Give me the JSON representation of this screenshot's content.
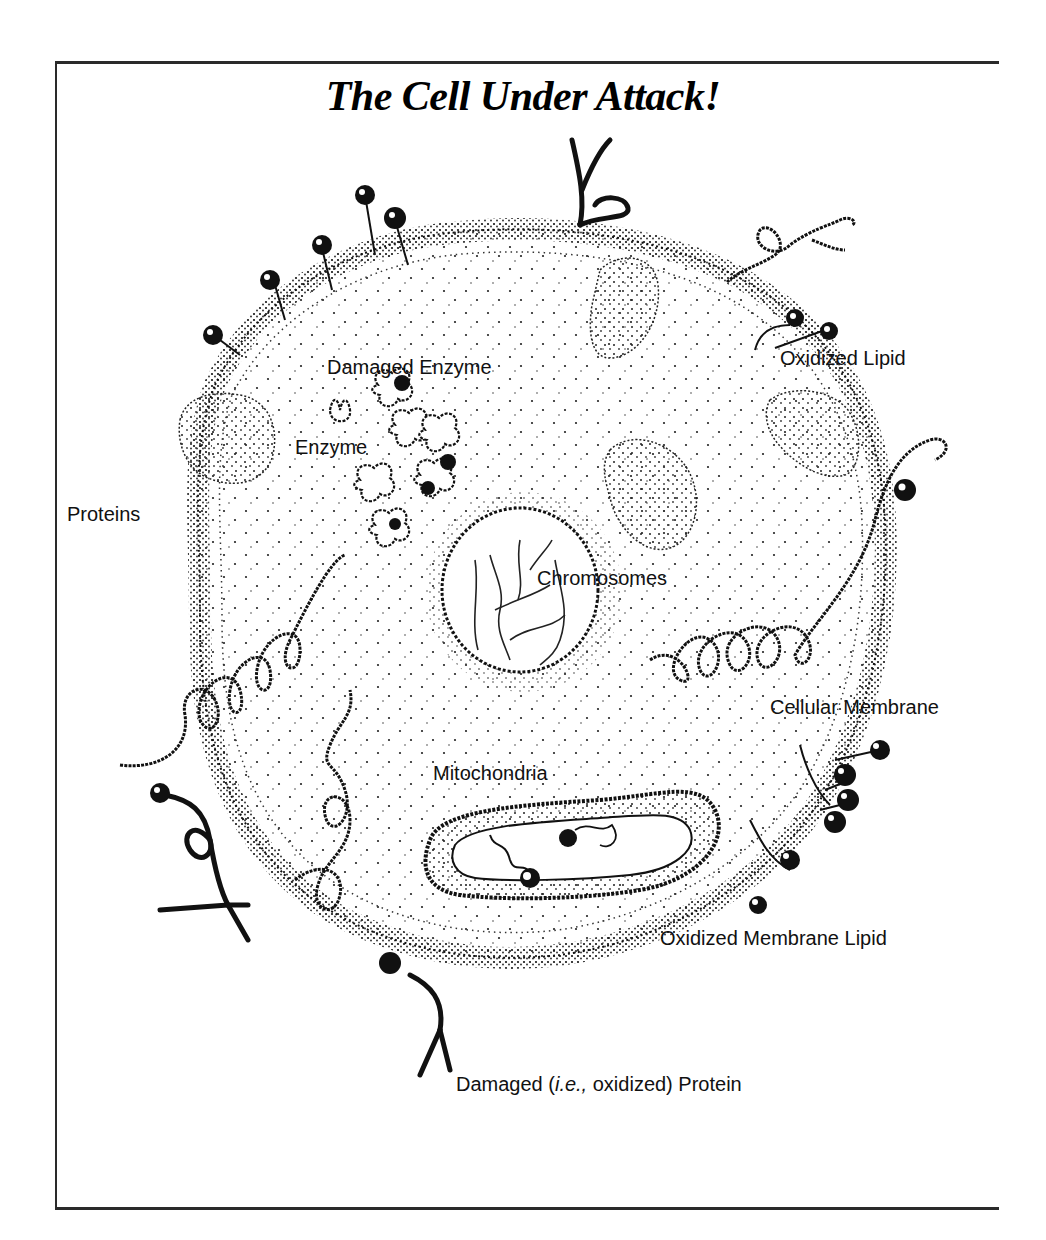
{
  "figure": {
    "title": "The Cell Under Attack!",
    "labels": {
      "damaged_enzyme": "Damaged Enzyme",
      "enzyme": "Enzyme",
      "oxidized_lipid": "Oxidized Lipid",
      "proteins": "Proteins",
      "chromosomes": "Chromosomes",
      "cellular_membrane": "Cellular Membrane",
      "mitochondria": "Mitochondria",
      "oxidized_membrane_lipid": "Oxidized Membrane Lipid",
      "damaged_protein_prefix": "Damaged (",
      "damaged_protein_ie": "i.e.,",
      "damaged_protein_suffix": " oxidized) Protein"
    },
    "colors": {
      "ink": "#111111",
      "background": "#ffffff",
      "frame": "#2a2a2a"
    }
  }
}
